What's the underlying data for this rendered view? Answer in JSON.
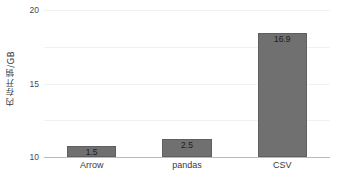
{
  "chart_data": {
    "type": "bar",
    "title": "",
    "xlabel": "",
    "ylabel": "内存开销/GB",
    "categories": [
      "Arrow",
      "pandas",
      "CSV"
    ],
    "values": [
      1.5,
      2.5,
      16.9
    ],
    "value_labels": [
      "1.5",
      "2.5",
      "16.9"
    ],
    "ylim": [
      0,
      20
    ],
    "yticks": [
      0,
      5,
      10,
      15,
      20
    ],
    "ytick_labels": [
      "0",
      "5",
      "10",
      "15",
      "20"
    ],
    "grid": true,
    "legend": false,
    "colors": {
      "bar_fill": "#707070",
      "bar_edge": "#5f5f5f",
      "gridline": "#f2f2f3",
      "axis_line": "#b9b9b9",
      "tick_text": "#4a4a4a",
      "value_text": "#1c1c1c",
      "background": "#ffffff"
    }
  }
}
